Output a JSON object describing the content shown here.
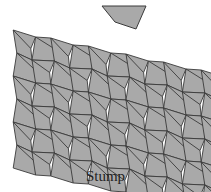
{
  "caption": "Stump",
  "colors": {
    "tile_fill": "#a9a9a9",
    "tile_stroke": "#3a3a3a",
    "background": "#ffffff"
  },
  "single_tile": {
    "points": [
      [
        102,
        6
      ],
      [
        146,
        6
      ],
      [
        136,
        29
      ],
      [
        115,
        22
      ]
    ]
  },
  "tiling": {
    "columns": 11,
    "rows": 6,
    "origin_x": 15,
    "origin_y": 30,
    "col_width": 18.8,
    "row_height": 23,
    "col_drop": 4,
    "zigzag": 3
  }
}
